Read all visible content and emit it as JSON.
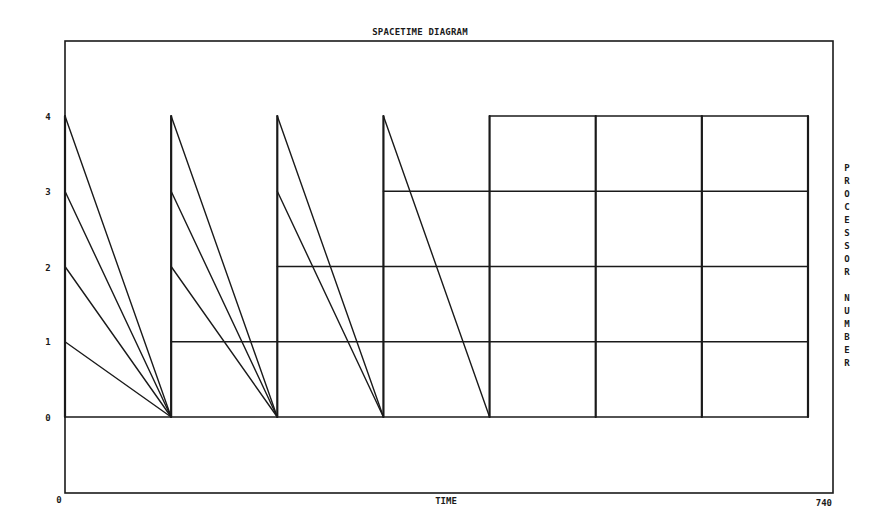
{
  "chart_data": {
    "type": "line",
    "title": "SPACETIME DIAGRAM",
    "xlabel": "TIME",
    "ylabel": "PROCESSOR NUMBER",
    "xlim": [
      0,
      740
    ],
    "ylim": [
      -1,
      5
    ],
    "x_tick_labels": [
      "0",
      "740"
    ],
    "y_ticks": [
      0,
      1,
      2,
      3,
      4
    ],
    "y_tick_labels": [
      "0",
      "1",
      "2",
      "3",
      "4"
    ],
    "grid": false,
    "legend": null,
    "phase_boundaries": [
      0,
      105,
      210,
      315,
      420,
      525,
      630,
      735
    ],
    "diagonal_messages": [
      {
        "from": [
          0,
          4
        ],
        "to": [
          105,
          0
        ]
      },
      {
        "from": [
          0,
          3
        ],
        "to": [
          105,
          0
        ]
      },
      {
        "from": [
          0,
          2
        ],
        "to": [
          105,
          0
        ]
      },
      {
        "from": [
          0,
          1
        ],
        "to": [
          105,
          0
        ]
      },
      {
        "from": [
          105,
          4
        ],
        "to": [
          210,
          0
        ]
      },
      {
        "from": [
          105,
          3
        ],
        "to": [
          210,
          0
        ]
      },
      {
        "from": [
          105,
          2
        ],
        "to": [
          210,
          0
        ]
      },
      {
        "from": [
          210,
          4
        ],
        "to": [
          315,
          0
        ]
      },
      {
        "from": [
          210,
          3
        ],
        "to": [
          315,
          0
        ]
      },
      {
        "from": [
          315,
          4
        ],
        "to": [
          420,
          0
        ]
      }
    ],
    "horizontal_activity": [
      {
        "processor": 0,
        "x": [
          0,
          735
        ]
      },
      {
        "processor": 1,
        "x": [
          105,
          735
        ]
      },
      {
        "processor": 2,
        "x": [
          210,
          735
        ]
      },
      {
        "processor": 3,
        "x": [
          315,
          735
        ]
      },
      {
        "processor": 4,
        "x": [
          420,
          735
        ]
      }
    ],
    "vertical_sync": [
      {
        "x": 105,
        "y": [
          0,
          4
        ]
      },
      {
        "x": 210,
        "y": [
          0,
          4
        ]
      },
      {
        "x": 315,
        "y": [
          0,
          4
        ]
      },
      {
        "x": 420,
        "y": [
          0,
          4
        ]
      },
      {
        "x": 525,
        "y": [
          0,
          4
        ]
      },
      {
        "x": 630,
        "y": [
          0,
          4
        ]
      },
      {
        "x": 735,
        "y": [
          0,
          4
        ]
      }
    ]
  },
  "labels": {
    "title": "SPACETIME DIAGRAM",
    "xlabel": "TIME",
    "ylabel_letters": [
      "P",
      "R",
      "O",
      "C",
      "E",
      "S",
      "S",
      "O",
      "R",
      "",
      "N",
      "U",
      "M",
      "B",
      "E",
      "R"
    ],
    "x_min": "0",
    "x_max": "740",
    "y0": "0",
    "y1": "1",
    "y2": "2",
    "y3": "3",
    "y4": "4"
  },
  "colors": {
    "ink": "#1a1a1a",
    "background": "#ffffff"
  }
}
